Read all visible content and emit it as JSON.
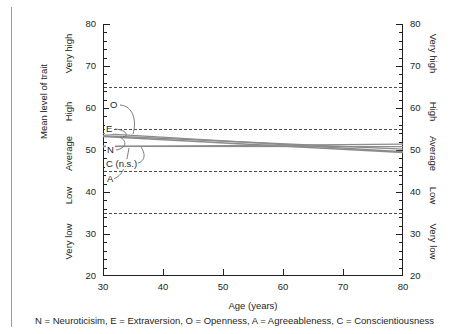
{
  "chart_data": {
    "type": "line",
    "title": "",
    "xlabel": "Age (years)",
    "ylabel": "Mean level of trait",
    "ylabel_right": "",
    "xlim": [
      30,
      80
    ],
    "ylim": [
      20,
      80
    ],
    "x_ticks": [
      30,
      40,
      50,
      60,
      70,
      80
    ],
    "y_ticks": [
      20,
      30,
      40,
      50,
      60,
      70,
      80
    ],
    "y_minor_step": 2,
    "grid": false,
    "legend_position": "inline-leader-labels",
    "reference_lines": [
      {
        "value": 65,
        "style": "dashed"
      },
      {
        "value": 55,
        "style": "dashed"
      },
      {
        "value": 45,
        "style": "dashed"
      },
      {
        "value": 35,
        "style": "dashed"
      }
    ],
    "y_bands": [
      {
        "label": "Very high",
        "from": 65,
        "to": 80
      },
      {
        "label": "High",
        "from": 55,
        "to": 65
      },
      {
        "label": "Average",
        "from": 45,
        "to": 55
      },
      {
        "label": "Low",
        "from": 35,
        "to": 45
      },
      {
        "label": "Very low",
        "from": 20,
        "to": 35
      }
    ],
    "x": [
      30,
      80
    ],
    "series": [
      {
        "name": "O",
        "key": "openness",
        "label": "O",
        "values": [
          53.9,
          49.6
        ],
        "color": "#8c8c8c"
      },
      {
        "name": "E",
        "key": "extraversion",
        "label": "E",
        "values": [
          53.4,
          50.2
        ],
        "color": "#8c8c8c"
      },
      {
        "name": "N",
        "key": "neuroticism",
        "label": "N",
        "values": [
          53.2,
          49.4
        ],
        "color": "#8c8c8c"
      },
      {
        "name": "C",
        "key": "conscientiousness",
        "label": "C (n.s.)",
        "values": [
          50.9,
          50.8
        ],
        "color": "#8c8c8c"
      },
      {
        "name": "A",
        "key": "agreeableness",
        "label": "A",
        "values": [
          50.8,
          51.4
        ],
        "color": "#8c8c8c"
      }
    ]
  },
  "axes": {
    "left": {
      "title": "Mean level of trait",
      "tick_labels": [
        "80",
        "70",
        "60",
        "50",
        "40",
        "30",
        "20"
      ],
      "band_labels": [
        "Very high",
        "High",
        "Average",
        "Low",
        "Very low"
      ]
    },
    "right": {
      "tick_labels": [
        "80",
        "70",
        "60",
        "50",
        "40",
        "30",
        "20"
      ],
      "band_labels": [
        "Very high",
        "High",
        "Average",
        "Low",
        "Very low"
      ]
    },
    "bottom": {
      "title": "Age (years)",
      "tick_labels": [
        "30",
        "40",
        "50",
        "60",
        "70",
        "80"
      ]
    }
  },
  "trait_labels": {
    "openness": "O",
    "extraversion": "E",
    "neuroticism": "N",
    "conscientiousness": "C (n.s.)",
    "agreeableness": "A"
  },
  "footnote": {
    "text": "N = Neuroticisim, E = Extraversion, O = Openness, A = Agreeableness, C = Conscientiousness"
  },
  "colors": {
    "ink": "#231f20",
    "series_line": "#8c8c8c",
    "reference_line": "#4d4d4d",
    "rule": "#9b9b9b"
  }
}
